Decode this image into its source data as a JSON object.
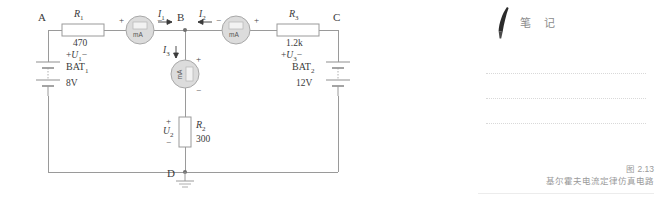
{
  "figure": {
    "nodes": [
      {
        "id": "A",
        "label": "A"
      },
      {
        "id": "B",
        "label": "B"
      },
      {
        "id": "C",
        "label": "C"
      },
      {
        "id": "D",
        "label": "D"
      }
    ],
    "resistors": [
      {
        "id": "R1",
        "name": "R",
        "sub": "1",
        "value": "470",
        "voltage_plus": "+",
        "voltage_name": "U",
        "voltage_sub": "1",
        "voltage_minus": "−",
        "orientation": "horizontal"
      },
      {
        "id": "R2",
        "name": "R",
        "sub": "2",
        "value": "300",
        "voltage_plus": "+",
        "voltage_name": "U",
        "voltage_sub": "2",
        "voltage_minus": "−",
        "orientation": "vertical"
      },
      {
        "id": "R3",
        "name": "R",
        "sub": "3",
        "value": "1.2k",
        "voltage_plus": "+",
        "voltage_name": "U",
        "voltage_sub": "3",
        "voltage_minus": "−",
        "orientation": "horizontal"
      }
    ],
    "batteries": [
      {
        "id": "BAT1",
        "name": "BAT",
        "sub": "1",
        "value": "8V"
      },
      {
        "id": "BAT2",
        "name": "BAT",
        "sub": "2",
        "value": "12V"
      }
    ],
    "meters": [
      {
        "id": "M1",
        "text": "mA",
        "plus": "+",
        "minus": "−",
        "orientation": "horizontal"
      },
      {
        "id": "M2",
        "text": "mA",
        "plus": "+",
        "minus": "−",
        "orientation": "horizontal"
      },
      {
        "id": "M3",
        "text": "mA",
        "plus": "+",
        "minus": "−",
        "orientation": "vertical"
      }
    ],
    "currents": [
      {
        "id": "I1",
        "name": "I",
        "sub": "1",
        "direction": "right"
      },
      {
        "id": "I2",
        "name": "I",
        "sub": "2",
        "direction": "left"
      },
      {
        "id": "I3",
        "name": "I",
        "sub": "3",
        "direction": "down"
      }
    ],
    "ground": {
      "at_node": "D"
    },
    "colors": {
      "wire": "#9a9a9a",
      "text": "#3a3a3a",
      "meter_fill": "#dcdcdc",
      "meter_stroke": "#a8a8a8",
      "resistor_fill": "#ffffff"
    }
  },
  "notes": {
    "title": "笔 记",
    "icon": "pen-icon",
    "line_count": 3
  },
  "caption": {
    "number": "图 2.13",
    "text": "基尔霍夫电流定律仿真电路"
  }
}
